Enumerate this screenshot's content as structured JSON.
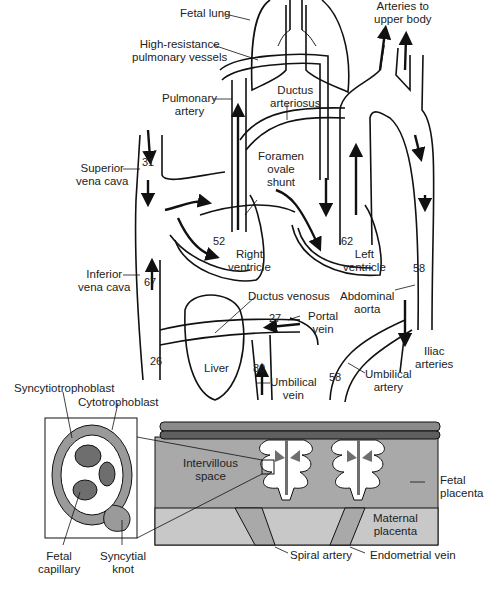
{
  "diagram": {
    "labels": {
      "fetal_lung": "Fetal lung",
      "high_resistance_1": "High-resistance",
      "high_resistance_2": "pulmonary vessels",
      "arteries_upper_1": "Arteries to",
      "arteries_upper_2": "upper body",
      "pulmonary_artery_1": "Pulmonary",
      "pulmonary_artery_2": "artery",
      "ductus_arteriosus_1": "Ductus",
      "ductus_arteriosus_2": "arteriosus",
      "superior_vc_1": "Superior",
      "superior_vc_2": "vena cava",
      "foramen_1": "Foramen",
      "foramen_2": "ovale",
      "foramen_3": "shunt",
      "right_ventricle_1": "Right",
      "right_ventricle_2": "ventricle",
      "left_ventricle_1": "Left",
      "left_ventricle_2": "ventricle",
      "inferior_vc_1": "Inferior",
      "inferior_vc_2": "vena cava",
      "ductus_venosus": "Ductus venosus",
      "abdominal_aorta_1": "Abdominal",
      "abdominal_aorta_2": "aorta",
      "portal_vein_1": "Portal",
      "portal_vein_2": "vein",
      "liver": "Liver",
      "iliac_1": "Iliac",
      "iliac_2": "arteries",
      "umbilical_vein_1": "Umbilical",
      "umbilical_vein_2": "vein",
      "umbilical_artery_1": "Umbilical",
      "umbilical_artery_2": "artery",
      "syncytiotrophoblast": "Syncytiotrophoblast",
      "cytotrophoblast": "Cytotrophoblast",
      "intervillous_1": "Intervillous",
      "intervillous_2": "space",
      "fetal_placenta_1": "Fetal",
      "fetal_placenta_2": "placenta",
      "maternal_placenta_1": "Maternal",
      "maternal_placenta_2": "placenta",
      "fetal_capillary_1": "Fetal",
      "fetal_capillary_2": "capillary",
      "syncytial_knot_1": "Syncytial",
      "syncytial_knot_2": "knot",
      "spiral_artery": "Spiral artery",
      "endometrial_vein": "Endometrial vein"
    },
    "oxygen_saturation": {
      "superior_vena_cava": "31",
      "right_ventricle": "52",
      "left_ventricle": "62",
      "descending_aorta": "58",
      "inferior_vena_cava": "67",
      "portal_vein": "27",
      "lower_ivc": "26",
      "umbilical_vein": "80",
      "umbilical_artery": "58"
    },
    "colors": {
      "line": "#111111",
      "fetal_placenta": "#a9a9a9",
      "maternal_placenta": "#c8c8c8",
      "vessel_dark": "#6e6e6e",
      "villus_fill": "#ffffff"
    }
  }
}
